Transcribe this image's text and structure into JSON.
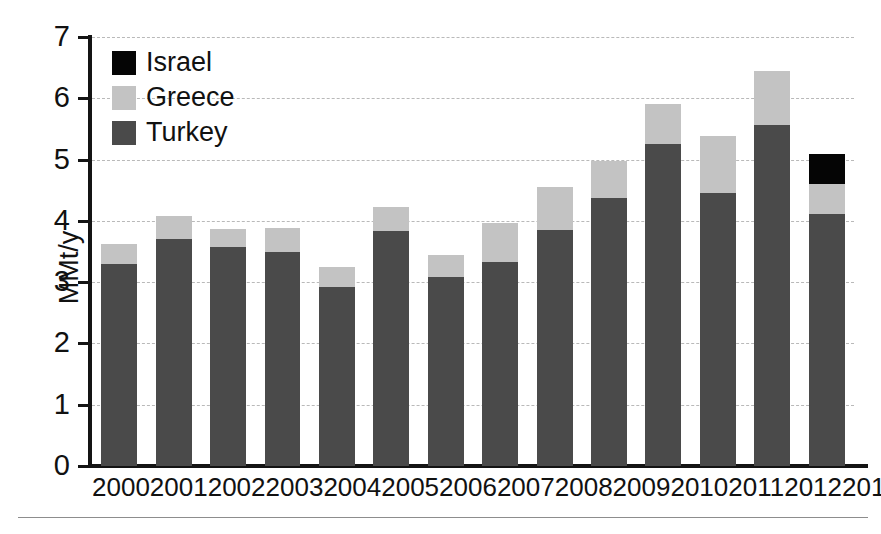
{
  "chart_data": {
    "type": "bar",
    "stacked": true,
    "title": "",
    "subtitle": "",
    "xlabel": "",
    "ylabel": "MMt/y",
    "categories": [
      "2000",
      "2001",
      "2002",
      "2003",
      "2004",
      "2005",
      "2006",
      "2007",
      "2008",
      "2009",
      "2010",
      "2011",
      "2012",
      "2013"
    ],
    "series": [
      {
        "name": "Turkey",
        "color": "#4a4a4a",
        "values": [
          3.3,
          3.7,
          3.57,
          3.5,
          2.92,
          3.84,
          3.08,
          3.33,
          3.85,
          4.37,
          5.26,
          4.45,
          5.57,
          4.12
        ]
      },
      {
        "name": "Greece",
        "color": "#c3c3c3",
        "values": [
          0.33,
          0.38,
          0.29,
          0.39,
          0.33,
          0.39,
          0.37,
          0.64,
          0.7,
          0.61,
          0.64,
          0.93,
          0.88,
          0.48
        ]
      },
      {
        "name": "Israel",
        "color": "#050505",
        "values": [
          0.0,
          0.0,
          0.0,
          0.0,
          0.0,
          0.0,
          0.0,
          0.0,
          0.0,
          0.0,
          0.0,
          0.0,
          0.0,
          0.49
        ]
      }
    ],
    "stack_order": [
      "Turkey",
      "Greece",
      "Israel"
    ],
    "totals": [
      3.63,
      4.08,
      3.86,
      3.89,
      3.25,
      4.23,
      3.45,
      3.97,
      4.55,
      4.98,
      5.9,
      5.38,
      6.45,
      5.09
    ],
    "ylim": [
      0,
      7
    ],
    "yticks": [
      0,
      1,
      2,
      3,
      4,
      5,
      6,
      7
    ],
    "ytick_labels": [
      "0",
      "1",
      "2",
      "3",
      "4",
      "5",
      "6",
      "7"
    ],
    "grid": true,
    "grid_style": "dashed",
    "grid_color": "#b9b9b9",
    "legend_position": "top-left",
    "legend": [
      {
        "label": "Israel",
        "color": "#050505"
      },
      {
        "label": "Greece",
        "color": "#c3c3c3"
      },
      {
        "label": "Turkey",
        "color": "#4a4a4a"
      }
    ]
  }
}
